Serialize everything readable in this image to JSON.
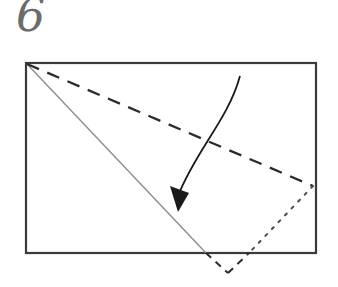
{
  "figure": {
    "kind": "origami-fold-diagram",
    "step_number": "6",
    "background_color": "#ffffff",
    "width": 338,
    "height": 287
  },
  "palette": {
    "paper_edge": "#3a3a3a",
    "valley_fold_dashed": "#2b2b2b",
    "existing_crease_solid": "#8d8d8d",
    "hidden_edge_dotted": "#4a4a4a",
    "arrow": "#1a1a1a",
    "step_number_color": "#6b6b6b"
  },
  "paper_sheet": {
    "name": "rectangular-sheet",
    "x": 26,
    "y": 63,
    "width": 290,
    "height": 190,
    "stroke_width": 2.2
  },
  "lines": {
    "valley_fold": {
      "label": "valley-fold-dashed-line",
      "style": "dashed",
      "from": [
        27,
        64
      ],
      "to": [
        313,
        186
      ],
      "stroke_width": 2.3,
      "dash": "13 9"
    },
    "existing_crease": {
      "label": "existing-crease-solid-line",
      "style": "solid",
      "from": [
        27,
        64
      ],
      "to": [
        206,
        253
      ],
      "stroke_width": 1.4
    },
    "hidden_flap_edge": {
      "label": "hidden-flap-dotted-line",
      "style": "dotted",
      "from": [
        313,
        186
      ],
      "to": [
        249,
        253
      ],
      "stroke_width": 2.0,
      "dash": "2.5 7"
    },
    "flap_tip_left": {
      "label": "flap-tip-dashed-left",
      "style": "dashed",
      "from": [
        206,
        253
      ],
      "to": [
        228,
        273
      ],
      "stroke_width": 2.0,
      "dash": "7 6"
    },
    "flap_tip_right": {
      "label": "flap-tip-dashed-right",
      "style": "dashed",
      "from": [
        228,
        273
      ],
      "to": [
        249,
        253
      ],
      "stroke_width": 2.0,
      "dash": "7 6"
    }
  },
  "fold_arrow": {
    "label": "fold-direction-arrow",
    "curve_start": [
      240,
      76
    ],
    "curve_control_1": [
      228,
      120
    ],
    "curve_control_2": [
      196,
      150
    ],
    "curve_end": [
      178,
      196
    ],
    "stroke_width": 1.8,
    "head_points": "178,212 170,186 189,193",
    "direction": "down-left"
  }
}
